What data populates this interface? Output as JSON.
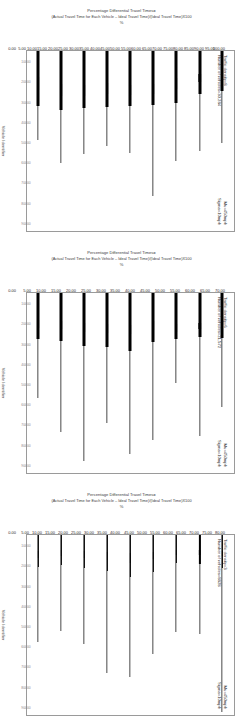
{
  "figure": {
    "value_axis_title_line1": "Percentage Differential Travel Times=",
    "value_axis_title_line2": "(Actual Travel Time for Each Vehicle – Ideal Travel Time)/(Ideal Travel Time)X100",
    "value_axis_unit": "%",
    "category_axis_title": "Vehicle Identifier",
    "subfigure_label": "(a)"
  },
  "chart_data": {
    "type": "box",
    "xlabel": "Vehicle Identifier",
    "ylabel": "Percentage Differential Travel Times= (Actual Travel Time for Each Vehicle – Ideal Travel Time)/(Ideal Travel Time)X100",
    "grid": false,
    "legend": "none",
    "orientation": "horizontal",
    "panels": [
      {
        "index": 1,
        "annotation_left": {
          "line1": "Traffic density=8",
          "line2": "Number of vehicles=30,284"
        },
        "annotation_right": {
          "line1": "Mu=450mph",
          "line2": "Sigma=10mph"
        },
        "ylim": [
          0,
          100
        ],
        "ytick_labels": [
          "100.00",
          "95.00",
          "90.00",
          "85.00",
          "80.00",
          "75.00",
          "70.00",
          "65.00",
          "60.00",
          "55.00",
          "50.00",
          "45.00",
          "40.00",
          "35.00",
          "30.00",
          "25.00",
          "20.00",
          "15.00",
          "10.00",
          "5.00",
          "0.00"
        ],
        "ytick_values": [
          100,
          95,
          90,
          85,
          80,
          75,
          70,
          65,
          60,
          55,
          50,
          45,
          40,
          35,
          30,
          25,
          20,
          15,
          10,
          5,
          0
        ],
        "categories": [
          "10000",
          "20000",
          "30000",
          "40000",
          "50000",
          "60000",
          "70000",
          "80000",
          "90000"
        ],
        "boxes": [
          {
            "vehicle": "10000",
            "whisker_low": 0.0,
            "q1": 10.5,
            "median": 15.0,
            "q3": 22.0,
            "whisker_high": 51.0
          },
          {
            "vehicle": "20000",
            "whisker_low": 0.0,
            "q1": 13.0,
            "median": 17.5,
            "q3": 24.0,
            "whisker_high": 55.5
          },
          {
            "vehicle": "30000",
            "whisker_low": 0.0,
            "q1": 15.0,
            "median": 21.0,
            "q3": 29.0,
            "whisker_high": 61.0
          },
          {
            "vehicle": "40000",
            "whisker_low": 0.0,
            "q1": 18.5,
            "median": 24.0,
            "q3": 30.0,
            "whisker_high": 80.5
          },
          {
            "vehicle": "50000",
            "whisker_low": 0.0,
            "q1": 19.0,
            "median": 24.5,
            "q3": 30.5,
            "whisker_high": 56.5
          },
          {
            "vehicle": "60000",
            "whisker_low": 0.0,
            "q1": 18.0,
            "median": 24.0,
            "q3": 31.0,
            "whisker_high": 52.5
          },
          {
            "vehicle": "70000",
            "whisker_low": 0.0,
            "q1": 19.0,
            "median": 25.0,
            "q3": 31.5,
            "whisker_high": 57.0
          },
          {
            "vehicle": "80000",
            "whisker_low": 0.0,
            "q1": 18.5,
            "median": 25.0,
            "q3": 33.0,
            "whisker_high": 62.0
          },
          {
            "vehicle": "90000",
            "whisker_low": 0.0,
            "q1": 14.5,
            "median": 21.5,
            "q3": 30.5,
            "whisker_high": 49.5
          }
        ]
      },
      {
        "index": 2,
        "annotation_left": {
          "line1": "Traffic density=6",
          "line2": "Number of vehicles=21,572"
        },
        "annotation_right": {
          "line1": "Mu=450mph",
          "line2": "Sigma=10mph"
        },
        "ylim": [
          0,
          70
        ],
        "ytick_labels": [
          "70.00",
          "65.00",
          "60.00",
          "55.00",
          "50.00",
          "45.00",
          "40.00",
          "35.00",
          "30.00",
          "25.00",
          "20.00",
          "15.00",
          "10.00",
          "5.00",
          "0.00"
        ],
        "ytick_values": [
          70,
          65,
          60,
          55,
          50,
          45,
          40,
          35,
          30,
          25,
          20,
          15,
          10,
          5,
          0
        ],
        "categories": [
          "10000",
          "20000",
          "30000",
          "40000",
          "50000",
          "60000",
          "70000",
          "80000",
          "90000"
        ],
        "boxes": [
          {
            "vehicle": "10000",
            "whisker_low": 0.0,
            "q1": 9.5,
            "median": 12.5,
            "q3": 17.5,
            "whisker_high": 44.5
          },
          {
            "vehicle": "20000",
            "whisker_low": 0.0,
            "q1": 11.5,
            "median": 14.0,
            "q3": 17.0,
            "whisker_high": 55.5
          },
          {
            "vehicle": "30000",
            "whisker_low": 0.0,
            "q1": 12.0,
            "median": 15.0,
            "q3": 18.0,
            "whisker_high": 35.0
          },
          {
            "vehicle": "40000",
            "whisker_low": 0.0,
            "q1": 11.0,
            "median": 14.5,
            "q3": 19.0,
            "whisker_high": 57.0
          },
          {
            "vehicle": "50000",
            "whisker_low": 0.0,
            "q1": 12.5,
            "median": 16.0,
            "q3": 22.5,
            "whisker_high": 62.5
          },
          {
            "vehicle": "60000",
            "whisker_low": 0.0,
            "q1": 12.0,
            "median": 15.5,
            "q3": 21.0,
            "whisker_high": 50.5
          },
          {
            "vehicle": "70000",
            "whisker_low": 0.0,
            "q1": 11.5,
            "median": 15.0,
            "q3": 20.5,
            "whisker_high": 65.5
          },
          {
            "vehicle": "80000",
            "whisker_low": 0.0,
            "q1": 11.0,
            "median": 14.0,
            "q3": 18.5,
            "whisker_high": 54.0
          },
          {
            "vehicle": "90000",
            "whisker_low": 0.0,
            "q1": 10.5,
            "median": 13.5,
            "q3": 18.0,
            "whisker_high": 41.0
          }
        ]
      },
      {
        "index": 3,
        "annotation_left": {
          "line1": "Traffic density=3",
          "line2": "Number of vehicles=8828"
        },
        "annotation_right": {
          "line1": "Mu=450mph",
          "line2": "Sigma=10mph"
        },
        "ylim": [
          0,
          80
        ],
        "ytick_labels": [
          "80.00",
          "75.00",
          "70.00",
          "65.00",
          "60.00",
          "55.00",
          "50.00",
          "45.00",
          "40.00",
          "35.00",
          "30.00",
          "25.00",
          "20.00",
          "15.00",
          "10.00",
          "5.00",
          "0.00"
        ],
        "ytick_values": [
          80,
          75,
          70,
          65,
          60,
          55,
          50,
          45,
          40,
          35,
          30,
          25,
          20,
          15,
          10,
          5,
          0
        ],
        "categories": [
          "10000",
          "20000",
          "30000",
          "40000",
          "50000",
          "60000",
          "70000",
          "80000",
          "90000"
        ],
        "boxes": [
          {
            "vehicle": "10000",
            "whisker_low": 0.0,
            "q1": 7.0,
            "median": 9.5,
            "q3": 14.5,
            "whisker_high": 78.5
          },
          {
            "vehicle": "20000",
            "whisker_low": 0.0,
            "q1": 6.5,
            "median": 9.0,
            "q3": 13.0,
            "whisker_high": 44.0
          },
          {
            "vehicle": "30000",
            "whisker_low": 0.0,
            "q1": 6.5,
            "median": 9.0,
            "q3": 12.5,
            "whisker_high": 43.0
          },
          {
            "vehicle": "40000",
            "whisker_low": 0.0,
            "q1": 7.5,
            "median": 10.5,
            "q3": 16.5,
            "whisker_high": 53.0
          },
          {
            "vehicle": "50000",
            "whisker_low": 0.0,
            "q1": 8.0,
            "median": 12.5,
            "q3": 18.5,
            "whisker_high": 63.0
          },
          {
            "vehicle": "60000",
            "whisker_low": 0.0,
            "q1": 7.5,
            "median": 11.0,
            "q3": 16.0,
            "whisker_high": 61.5
          },
          {
            "vehicle": "70000",
            "whisker_low": 0.0,
            "q1": 7.0,
            "median": 10.0,
            "q3": 14.5,
            "whisker_high": 48.5
          },
          {
            "vehicle": "80000",
            "whisker_low": 0.0,
            "q1": 6.5,
            "median": 9.5,
            "q3": 13.5,
            "whisker_high": 42.5
          },
          {
            "vehicle": "90000",
            "whisker_low": 0.0,
            "q1": 7.0,
            "median": 10.0,
            "q3": 14.0,
            "whisker_high": 47.5
          }
        ]
      }
    ]
  }
}
